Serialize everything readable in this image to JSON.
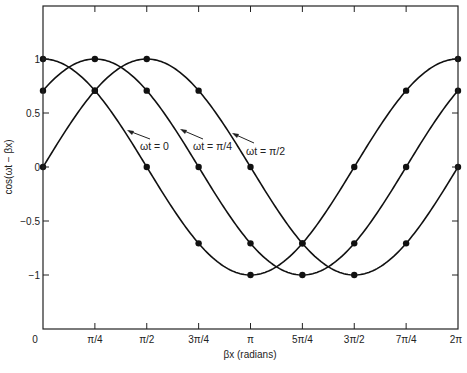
{
  "chart_data": {
    "type": "line",
    "title": "",
    "xlabel": "βx (radians)",
    "ylabel": "cos(ωt − βx)",
    "x_tick_labels": [
      "0",
      "π/4",
      "π/2",
      "3π/4",
      "π",
      "5π/4",
      "3π/2",
      "7π/4",
      "2π"
    ],
    "x": [
      0,
      0.7854,
      1.5708,
      2.3562,
      3.1416,
      3.927,
      4.7124,
      5.4978,
      6.2832
    ],
    "y_tick_labels": [
      "1",
      "0.5",
      "0",
      "−0.5",
      "−1"
    ],
    "y_ticks": [
      1,
      0.5,
      0,
      -0.5,
      -1
    ],
    "xlim": [
      0,
      6.2832
    ],
    "ylim": [
      -1.45,
      1.5
    ],
    "grid": false,
    "legend": "none (inline arrow annotations)",
    "series": [
      {
        "name": "ωt = 0",
        "values": [
          1,
          0.707,
          0,
          -0.707,
          -1,
          -0.707,
          0,
          0.707,
          1
        ]
      },
      {
        "name": "ωt = π/4",
        "values": [
          0.707,
          1,
          0.707,
          0,
          -0.707,
          -1,
          -0.707,
          0,
          0.707
        ]
      },
      {
        "name": "ωt = π/2",
        "values": [
          0,
          0.707,
          1,
          0.707,
          0,
          -0.707,
          -1,
          -0.707,
          0
        ]
      }
    ],
    "annotations": [
      "ωt = 0",
      "ωt = π/4",
      "ωt = π/2"
    ]
  }
}
